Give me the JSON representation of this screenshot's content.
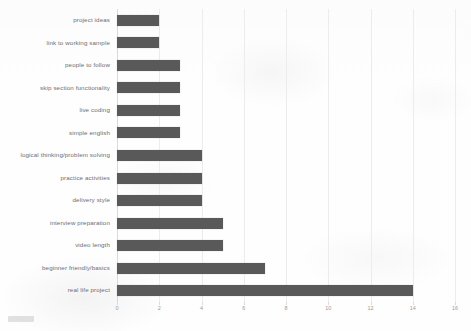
{
  "chart_data": {
    "type": "bar",
    "orientation": "horizontal",
    "title": "",
    "subtitle": "",
    "xlabel": "",
    "ylabel": "",
    "xlim": [
      0,
      16
    ],
    "xticks": [
      0,
      2,
      4,
      6,
      8,
      10,
      12,
      14,
      16
    ],
    "grid": true,
    "grid_axis": "x",
    "legend": false,
    "legend_position": "none",
    "bar_color": "#595959",
    "categories": [
      "project ideas",
      "link to working sample",
      "people to follow",
      "skip section functionality",
      "live coding",
      "simple english",
      "logical thinking/problem solving",
      "practice activities",
      "delivery style",
      "interview preparation",
      "video length",
      "beginner friendly/basics",
      "real life project"
    ],
    "values": [
      2,
      2,
      3,
      3,
      3,
      3,
      4,
      4,
      4,
      5,
      5,
      7,
      14
    ]
  }
}
